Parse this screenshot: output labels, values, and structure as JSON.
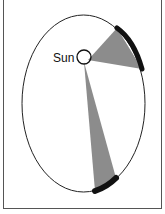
{
  "diagram": {
    "sun_label": "Sun",
    "colors": {
      "orbit": "#222222",
      "sector_fill": "#808080",
      "arc_marker": "#111111",
      "frame": "#555555"
    },
    "elements": [
      {
        "type": "ellipse",
        "name": "orbit"
      },
      {
        "type": "circle",
        "name": "sun",
        "label": "Sun"
      },
      {
        "type": "sector",
        "name": "sector-near-sun",
        "position": "upper-right"
      },
      {
        "type": "sector",
        "name": "sector-far-from-sun",
        "position": "bottom"
      }
    ]
  }
}
